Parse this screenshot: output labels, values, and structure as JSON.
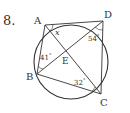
{
  "problem": {
    "number": "8."
  },
  "points": [
    {
      "name": "A",
      "x": 45,
      "y": 25
    },
    {
      "name": "B",
      "x": 37,
      "y": 74
    },
    {
      "name": "C",
      "x": 101,
      "y": 94
    },
    {
      "name": "D",
      "x": 103,
      "y": 21
    },
    {
      "name": "E",
      "x": 66,
      "y": 52
    }
  ],
  "angles": [
    {
      "label": "x",
      "at": "A"
    },
    {
      "label": "54°",
      "at": "D"
    },
    {
      "label": "41°",
      "at": "B"
    },
    {
      "label": "32°",
      "at": "C"
    }
  ],
  "labels": {
    "A": "A",
    "B": "B",
    "C": "C",
    "D": "D",
    "E": "E",
    "x": "x",
    "d54": "54",
    "d41": "41",
    "d32": "32",
    "deg": "°"
  }
}
